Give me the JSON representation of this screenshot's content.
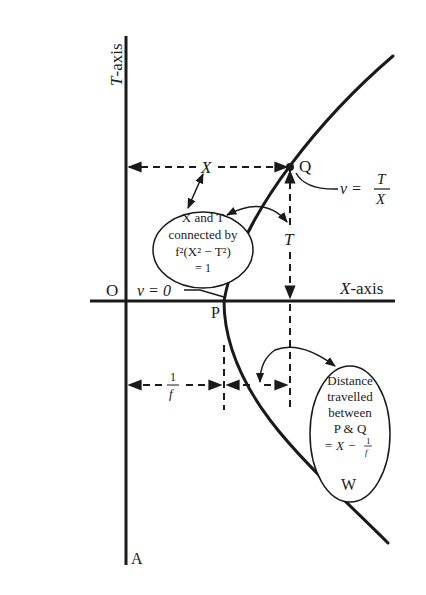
{
  "diagram": {
    "axes": {
      "t_axis_label_italic": "T",
      "t_axis_label_rest": "-axis",
      "x_axis_label_italic": "X",
      "x_axis_label_rest": "-axis",
      "origin_label": "O",
      "bottom_label": "A"
    },
    "points": {
      "P": "P",
      "Q": "Q",
      "W": "W"
    },
    "dimension_labels": {
      "X": "X",
      "T": "T",
      "one_over_f_num": "1",
      "one_over_f_den": "f"
    },
    "annotations": {
      "v_zero": "v = 0",
      "v_eq_lhs": "v =",
      "v_eq_num": "T",
      "v_eq_den": "X"
    },
    "callout_left": {
      "line1": "X and T",
      "line2": "connected by",
      "line3": "f²(X² − T²)",
      "line4": "= 1"
    },
    "callout_right": {
      "line1": "Distance",
      "line2": "travelled",
      "line3": "between",
      "line4": "P & Q",
      "line5_prefix": "= X −",
      "line5_num": "1",
      "line5_den": "f"
    },
    "colors": {
      "ink": "#1a1a1a",
      "background": "#ffffff"
    }
  }
}
